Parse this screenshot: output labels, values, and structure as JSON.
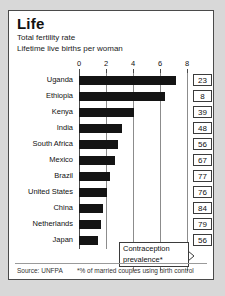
{
  "card": {
    "title": "Life",
    "subtitle1": "Total fertility rate",
    "subtitle2": "Lifetime live births per woman",
    "source": "Source: UNFPA",
    "footnote": "*% of married couples using birth control"
  },
  "callout": {
    "line1": "Contraception",
    "line2": "prevalence*"
  },
  "chart_data": {
    "type": "bar",
    "title": "Life",
    "subtitle": "Total fertility rate — Lifetime live births per woman",
    "orientation": "horizontal",
    "xlabel": "",
    "ylabel": "",
    "xlim": [
      0,
      8
    ],
    "ticks": [
      0,
      2,
      4,
      6,
      8
    ],
    "tick_labels": [
      "0",
      "2",
      "4",
      "6",
      "8"
    ],
    "grid": true,
    "legend": "none",
    "categories": [
      "Uganda",
      "Ethiopia",
      "Kenya",
      "India",
      "South Africa",
      "Mexico",
      "Brazil",
      "United States",
      "China",
      "Netherlands",
      "Japan"
    ],
    "values": [
      7.2,
      6.4,
      4.1,
      3.2,
      2.9,
      2.7,
      2.3,
      2.1,
      1.8,
      1.6,
      1.4
    ],
    "series": [
      {
        "name": "Total fertility rate",
        "values": [
          7.2,
          6.4,
          4.1,
          3.2,
          2.9,
          2.7,
          2.3,
          2.1,
          1.8,
          1.6,
          1.4
        ]
      },
      {
        "name": "Contraception prevalence*",
        "units": "% of married couples using birth control",
        "values": [
          23,
          8,
          39,
          48,
          56,
          67,
          77,
          76,
          84,
          79,
          56
        ]
      }
    ],
    "bar_color": "#141414",
    "source": "Source: UNFPA",
    "annotation": "*% of married couples using birth control"
  }
}
